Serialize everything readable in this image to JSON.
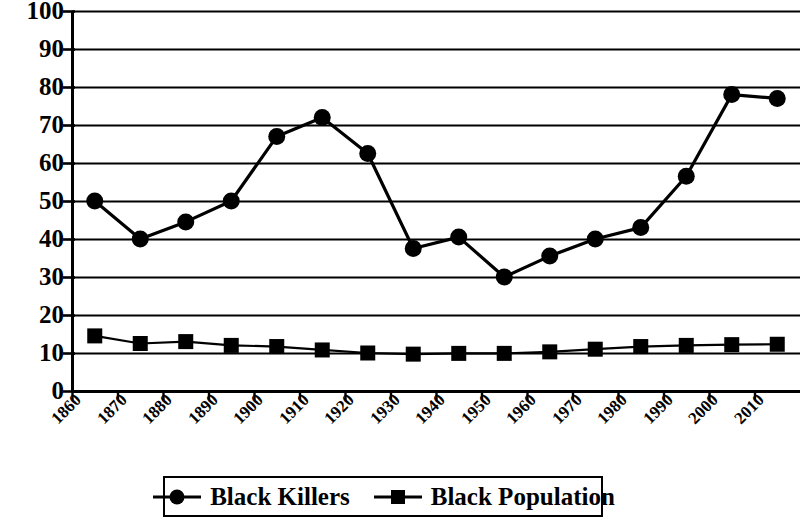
{
  "chart_data": {
    "type": "line",
    "title": "",
    "xlabel": "",
    "ylabel": "",
    "ylim": [
      0,
      100
    ],
    "ytick_step": 10,
    "yticks": [
      "0",
      "10",
      "20",
      "30",
      "40",
      "50",
      "60",
      "70",
      "80",
      "90",
      "100"
    ],
    "categories": [
      "1860",
      "1870",
      "1880",
      "1890",
      "1900",
      "1910",
      "1920",
      "1930",
      "1940",
      "1950",
      "1960",
      "1970",
      "1980",
      "1990",
      "2000",
      "2010"
    ],
    "grid": "horizontal",
    "legend_position": "bottom",
    "series": [
      {
        "name": "Black Killers",
        "marker": "circle",
        "color": "#000000",
        "values": [
          50,
          40,
          44.5,
          50,
          67,
          72,
          62.5,
          37.5,
          40.5,
          30,
          35.5,
          40,
          43,
          56.5,
          78,
          77
        ]
      },
      {
        "name": "Black Population",
        "marker": "square",
        "color": "#000000",
        "values": [
          14.5,
          12.5,
          13,
          12,
          11.7,
          10.8,
          10,
          9.7,
          9.9,
          9.9,
          10.3,
          11,
          11.7,
          12,
          12.2,
          12.3
        ]
      }
    ]
  },
  "legend": {
    "items": [
      {
        "label": "Black Killers",
        "marker": "circle"
      },
      {
        "label": "Black Population",
        "marker": "square"
      }
    ]
  },
  "axes": {
    "y_tick_labels": [
      "100",
      "90",
      "80",
      "70",
      "60",
      "50",
      "40",
      "30",
      "20",
      "10",
      "0"
    ],
    "x_tick_labels": [
      "1860",
      "1870",
      "1880",
      "1890",
      "1900",
      "1910",
      "1920",
      "1930",
      "1940",
      "1950",
      "1960",
      "1970",
      "1980",
      "1990",
      "2000",
      "2010"
    ]
  }
}
